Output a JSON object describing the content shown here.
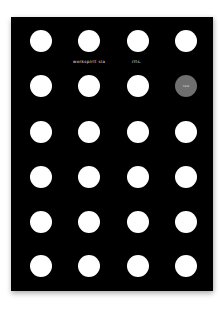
{
  "card": {
    "background": "#000000",
    "dot_color": "#ffffff",
    "accent_color": "#6f6f6f",
    "grid": {
      "rows": 6,
      "cols": 4
    }
  },
  "captions": {
    "company": "workspirit sia",
    "word": "rīts."
  },
  "accent_dot": {
    "label": "new",
    "row": 2,
    "col": 4
  }
}
